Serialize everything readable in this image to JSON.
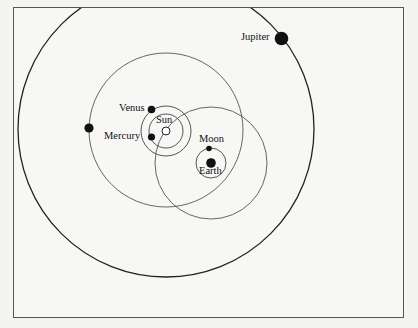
{
  "diagram": {
    "type": "planetary system (Tychonic model)",
    "colors": {
      "line": "#333333",
      "dot": "#111111",
      "background": "#f7f7f5"
    },
    "bodies": [
      {
        "name": "Sun",
        "label": "Sun"
      },
      {
        "name": "Mercury",
        "label": "Mercury"
      },
      {
        "name": "Venus",
        "label": "Venus"
      },
      {
        "name": "Earth",
        "label": "Earth"
      },
      {
        "name": "Moon",
        "label": "Moon"
      },
      {
        "name": "Mars",
        "label": ""
      },
      {
        "name": "Jupiter",
        "label": "Jupiter"
      }
    ],
    "labels": {
      "sun": "Sun",
      "mercury": "Mercury",
      "venus": "Venus",
      "earth": "Earth",
      "moon": "Moon",
      "jupiter": "Jupiter"
    }
  }
}
